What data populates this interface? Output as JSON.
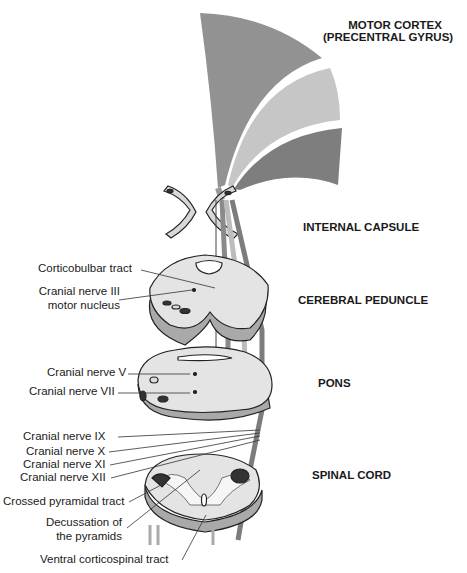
{
  "regions": {
    "motor_cortex_line1": "MOTOR CORTEX",
    "motor_cortex_line2": "(PRECENTRAL GYRUS)",
    "internal_capsule": "INTERNAL CAPSULE",
    "cerebral_peduncle": "CEREBRAL PEDUNCLE",
    "pons": "PONS",
    "spinal_cord": "SPINAL CORD"
  },
  "labels": {
    "corticobulbar": "Corticobulbar tract",
    "cn3_line1": "Cranial nerve III",
    "cn3_line2": "motor nucleus",
    "cn5": "Cranial nerve V",
    "cn7": "Cranial nerve VII",
    "cn9": "Cranial nerve IX",
    "cn10": "Cranial nerve X",
    "cn11": "Cranial nerve XI",
    "cn12": "Cranial nerve XII",
    "crossed_pyramidal": "Crossed pyramidal tract",
    "decussation_line1": "Decussation of",
    "decussation_line2": "the pyramids",
    "ventral_cst": "Ventral corticospinal tract"
  },
  "colors": {
    "cortex_dark": "#8f8f8f",
    "cortex_light": "#c4c4c4",
    "cortex_mid": "#7d7d7d",
    "tissue": "#e4e4e4",
    "tissue_side": "#a9a9a9",
    "outline": "#222222"
  }
}
